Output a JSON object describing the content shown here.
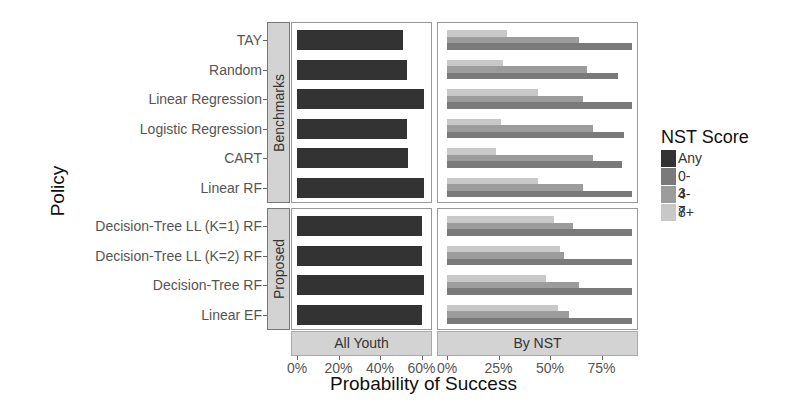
{
  "chart_data": {
    "type": "bar",
    "orientation": "horizontal",
    "xlabel": "Probability of Success",
    "ylabel": "Policy",
    "facet_rows": [
      "Benchmarks",
      "Proposed"
    ],
    "facet_cols": [
      "All Youth",
      "By NST"
    ],
    "legend": {
      "title": "NST Score",
      "position": "right",
      "entries": [
        {
          "label": "Any",
          "color": "#333333"
        },
        {
          "label": "0-3",
          "color": "#7a7a7a"
        },
        {
          "label": "4-7",
          "color": "#9c9c9c"
        },
        {
          "label": "8+",
          "color": "#c8c8c8"
        }
      ]
    },
    "axes": {
      "All Youth": {
        "ticks": [
          "0%",
          "20%",
          "40%",
          "60%"
        ],
        "xlim": [
          0,
          64
        ]
      },
      "By NST": {
        "ticks": [
          "0%",
          "25%",
          "50%",
          "75%"
        ],
        "xlim": [
          0,
          95
        ]
      }
    },
    "groups": [
      {
        "facet": "Benchmarks",
        "categories": [
          "TAY",
          "Random",
          "Linear Regression",
          "Logistic Regression",
          "CART",
          "Linear RF"
        ]
      },
      {
        "facet": "Proposed",
        "categories": [
          "Decision-Tree LL (K=1) RF",
          "Decision-Tree LL (K=2) RF",
          "Decision-Tree RF",
          "Linear EF"
        ]
      }
    ],
    "categories": [
      "TAY",
      "Random",
      "Linear Regression",
      "Logistic Regression",
      "CART",
      "Linear RF",
      "Decision-Tree LL (K=1) RF",
      "Decision-Tree LL (K=2) RF",
      "Decision-Tree RF",
      "Linear EF"
    ],
    "series": [
      {
        "name": "Any",
        "panel": "All Youth",
        "values": [
          51,
          53,
          61,
          53,
          53.5,
          61,
          60,
          60,
          61,
          60
        ]
      },
      {
        "name": "0-3",
        "panel": "By NST",
        "values": [
          90,
          83,
          90,
          86,
          85,
          90,
          90,
          90,
          90,
          90
        ]
      },
      {
        "name": "4-7",
        "panel": "By NST",
        "values": [
          64,
          68,
          66,
          71,
          71,
          66,
          61,
          57,
          64,
          59
        ]
      },
      {
        "name": "8+",
        "panel": "By NST",
        "values": [
          29,
          27,
          44,
          26,
          24,
          44,
          52,
          55,
          48,
          54
        ]
      }
    ],
    "grid": false
  }
}
